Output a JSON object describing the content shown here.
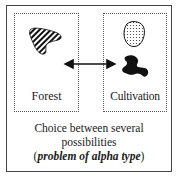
{
  "diagram": {
    "zones": [
      {
        "label": "Forest",
        "shape": "hatched-polygon"
      },
      {
        "label": "Cultivation",
        "shapes": [
          "dotted-blob",
          "solid-black-blob"
        ]
      }
    ],
    "connector": "double-headed-arrow",
    "caption": {
      "line1": "Choice between several",
      "line2": "possibilities",
      "line3_open": "(",
      "line3_emphasis": "problem of alpha type",
      "line3_close": ")"
    },
    "colors": {
      "frame": "#444444",
      "zone_border": "#555555",
      "fill_black": "#111111"
    }
  }
}
